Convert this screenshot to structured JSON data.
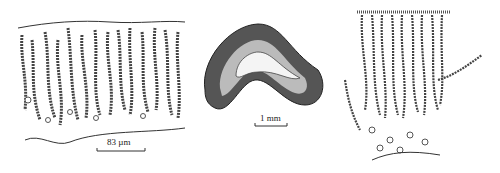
{
  "figure": {
    "panels": [
      {
        "id": "left",
        "description": "filamentous cross-section with chains",
        "scale_bar": "83 µm"
      },
      {
        "id": "middle",
        "description": "crescent-shaped thallus cross-section",
        "scale_bar": "1 mm"
      },
      {
        "id": "right",
        "description": "cortex with radiating filaments",
        "scale_bar": ""
      }
    ]
  }
}
